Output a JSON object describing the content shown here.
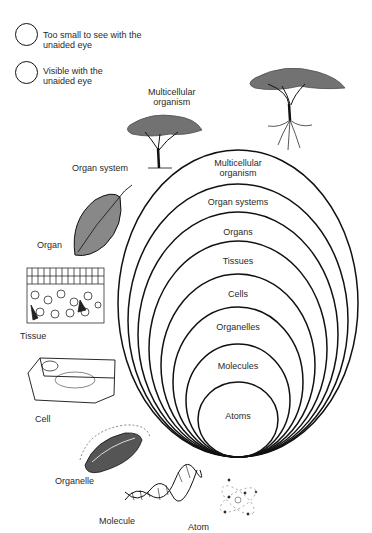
{
  "legend": [
    {
      "icon": "circle-outline-icon",
      "text_line1": "Too small to see with the",
      "text_line2": "unaided eye"
    },
    {
      "icon": "circle-outline-icon",
      "text_line1": "Visible with the",
      "text_line2": "unaided eye"
    }
  ],
  "illustrations": [
    {
      "name": "multicellular-organism",
      "label_line1": "Multicellular",
      "label_line2": "organism",
      "image": "tree-with-roots"
    },
    {
      "name": "organ-system",
      "label": "Organ system",
      "image": "tree"
    },
    {
      "name": "organ",
      "label": "Organ",
      "image": "leaf"
    },
    {
      "name": "tissue",
      "label": "Tissue",
      "image": "tissue-cross-section"
    },
    {
      "name": "cell",
      "label": "Cell",
      "image": "plant-cell"
    },
    {
      "name": "organelle",
      "label": "Organelle",
      "image": "chloroplast"
    },
    {
      "name": "molecule",
      "label": "Molecule",
      "image": "dna-double-helix"
    },
    {
      "name": "atom",
      "label": "Atom",
      "image": "atom-electrons"
    }
  ],
  "nested_levels": [
    {
      "label_line1": "Multicellular",
      "label_line2": "organism"
    },
    {
      "label_line1": "Organ systems"
    },
    {
      "label_line1": "Organs"
    },
    {
      "label_line1": "Tissues"
    },
    {
      "label_line1": "Cells"
    },
    {
      "label_line1": "Organelles"
    },
    {
      "label_line1": "Molecules"
    },
    {
      "label_line1": "Atoms"
    }
  ],
  "colors": {
    "stroke": "#111111",
    "text": "#2a2a2a",
    "background": "#ffffff"
  }
}
